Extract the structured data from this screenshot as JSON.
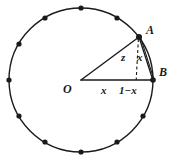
{
  "figure": {
    "type": "geometry-diagram",
    "width": 178,
    "height": 158,
    "background_color": "#ffffff",
    "stroke_color": "#1a1a1a"
  },
  "circle": {
    "center_x": 81,
    "center_y": 80,
    "radius": 72,
    "stroke_width": 1.4,
    "fill": "none"
  },
  "points": {
    "O": {
      "label": "O",
      "x": 81,
      "y": 80,
      "label_x": 64,
      "label_y": 86,
      "marked": false
    },
    "A": {
      "label": "A",
      "x": 139,
      "y": 37,
      "label_x": 146,
      "label_y": 27,
      "marked": true
    },
    "B": {
      "label": "B",
      "x": 153,
      "y": 80,
      "label_x": 158,
      "label_y": 70,
      "marked": true
    },
    "F": {
      "label": "",
      "x": 139,
      "y": 80,
      "marked": false
    }
  },
  "circumference_dots": [
    {
      "angle_deg": 90,
      "cx": 81,
      "cy": 8
    },
    {
      "angle_deg": 120,
      "cx": 45,
      "cy": 18
    },
    {
      "angle_deg": 150,
      "cx": 19,
      "cy": 44
    },
    {
      "angle_deg": 180,
      "cx": 9,
      "cy": 80
    },
    {
      "angle_deg": 210,
      "cx": 19,
      "cy": 116
    },
    {
      "angle_deg": 240,
      "cx": 45,
      "cy": 142
    },
    {
      "angle_deg": 270,
      "cx": 81,
      "cy": 152
    },
    {
      "angle_deg": 300,
      "cx": 117,
      "cy": 142
    },
    {
      "angle_deg": 330,
      "cx": 143,
      "cy": 116
    },
    {
      "angle_deg": 60,
      "cx": 117,
      "cy": 18
    },
    {
      "angle_deg": 0,
      "cx": 153,
      "cy": 80
    },
    {
      "angle_deg": 36,
      "cx": 139,
      "cy": 37
    }
  ],
  "dot_radius": 2.6,
  "segments": {
    "radius_OA": {
      "from": "O",
      "to": "A",
      "style": "solid",
      "stroke_width": 1.4
    },
    "radius_OB": {
      "from": "O",
      "to": "B",
      "style": "solid",
      "stroke_width": 1.4
    },
    "chord_AB": {
      "from": "A",
      "to": "B",
      "style": "solid-double",
      "stroke_width": 1.4
    },
    "perpendicular_AF": {
      "from": "A",
      "to": "F",
      "style": "dashed",
      "stroke_width": 1.1,
      "dash": "3,2.5"
    }
  },
  "labels": {
    "point_a": "A",
    "point_b": "B",
    "origin": "O",
    "segment_of": "x",
    "segment_fb": "1−x",
    "segment_af": "z",
    "segment_ab": "x"
  },
  "label_positions": {
    "segment_of": {
      "x": 92,
      "y": 88
    },
    "segment_fb": {
      "x": 120,
      "y": 88
    },
    "segment_af": {
      "x": 123,
      "y": 55
    },
    "segment_ab": {
      "x": 138,
      "y": 55
    }
  }
}
